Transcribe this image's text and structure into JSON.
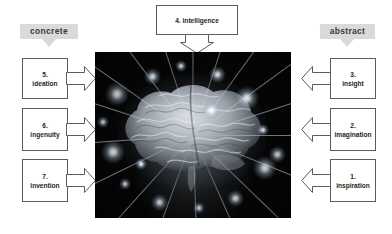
{
  "diagram": {
    "title_box": {
      "label": "4. intelligence"
    },
    "left_category": {
      "label": "concrete"
    },
    "right_category": {
      "label": "abstract"
    },
    "left_steps": [
      {
        "num": "5.",
        "word": "ideation"
      },
      {
        "num": "6.",
        "word": "ingenuity"
      },
      {
        "num": "7.",
        "word": "invention"
      }
    ],
    "right_steps": [
      {
        "num": "3.",
        "word": "insight"
      },
      {
        "num": "2.",
        "word": "imagination"
      },
      {
        "num": "1.",
        "word": "inspiration"
      }
    ],
    "center_image": {
      "alt": "glowing human brain with radiating light rays"
    },
    "colors": {
      "badge_fill": "#dadada",
      "box_stroke": "#5b5b5b",
      "text": "#262626",
      "canvas": "#ffffff",
      "image_bg": "#040404"
    }
  }
}
